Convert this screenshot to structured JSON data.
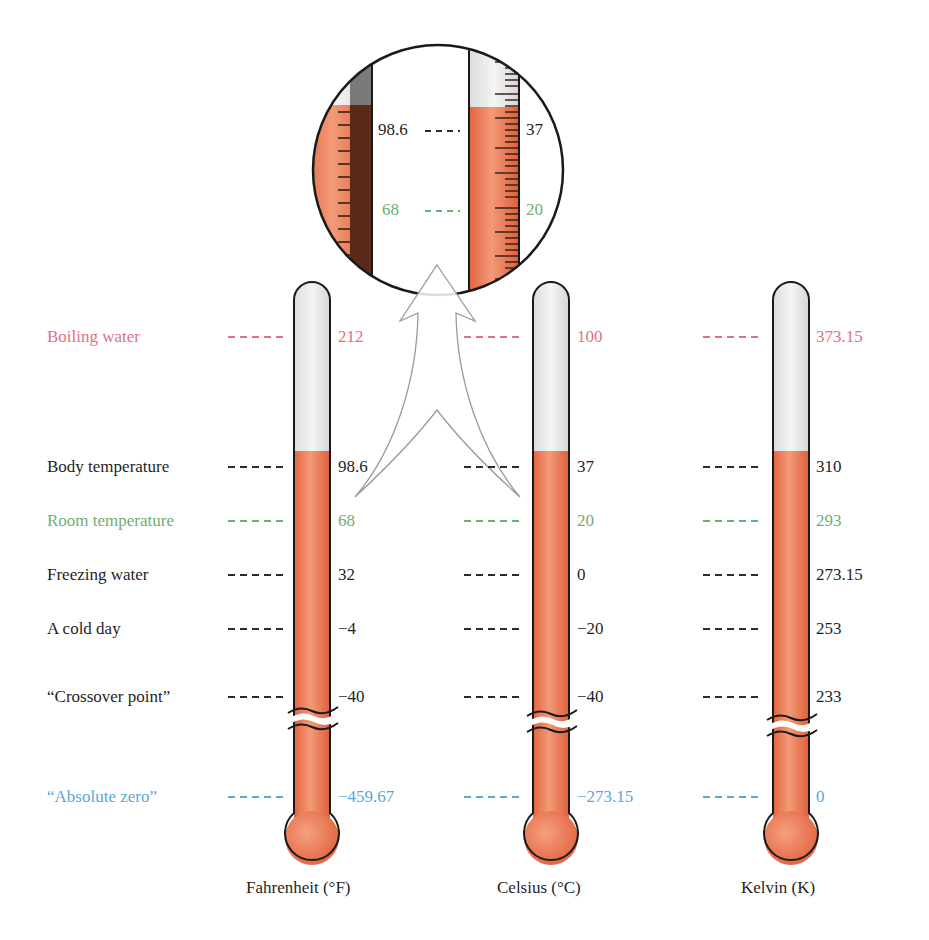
{
  "diagram": {
    "type": "thermometer-scale-comparison",
    "scales": [
      {
        "id": "fahrenheit",
        "name": "Fahrenheit (°F)"
      },
      {
        "id": "celsius",
        "name": "Celsius (°C)"
      },
      {
        "id": "kelvin",
        "name": "Kelvin (K)"
      }
    ],
    "reference_points": [
      {
        "label": "Boiling water",
        "color": "pink",
        "fahrenheit": "212",
        "celsius": "100",
        "kelvin": "373.15"
      },
      {
        "label": "Body temperature",
        "color": "black",
        "fahrenheit": "98.6",
        "celsius": "37",
        "kelvin": "310"
      },
      {
        "label": "Room temperature",
        "color": "green",
        "fahrenheit": "68",
        "celsius": "20",
        "kelvin": "293"
      },
      {
        "label": "Freezing water",
        "color": "black",
        "fahrenheit": "32",
        "celsius": "0",
        "kelvin": "273.15"
      },
      {
        "label": "A cold day",
        "color": "black",
        "fahrenheit": "−4",
        "celsius": "−20",
        "kelvin": "253"
      },
      {
        "label": "“Crossover point”",
        "color": "black",
        "fahrenheit": "−40",
        "celsius": "−40",
        "kelvin": "233"
      },
      {
        "label": "“Absolute zero”",
        "color": "blue",
        "fahrenheit": "−459.67",
        "celsius": "−273.15",
        "kelvin": "0"
      }
    ],
    "magnifier": {
      "body_fahrenheit": "98.6",
      "body_celsius": "37",
      "room_fahrenheit": "68",
      "room_celsius": "20"
    },
    "colors": {
      "pink": "#e0727f",
      "green": "#6daf72",
      "blue": "#5aa7d8",
      "mercury": "#ec7a55",
      "glass": "#ececec",
      "outline": "#1a1a1a"
    }
  }
}
